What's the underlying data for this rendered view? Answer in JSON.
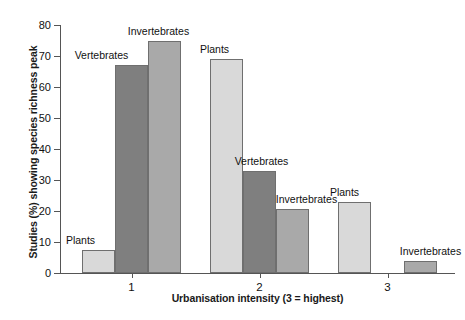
{
  "chart_data": {
    "type": "bar",
    "title": "",
    "xlabel": "Urbanisation intensity (3 = highest)",
    "ylabel": "Studies (%) showing species richness peak",
    "categories": [
      "1",
      "2",
      "3"
    ],
    "ylim": [
      0,
      80
    ],
    "yticks": [
      0,
      10,
      20,
      30,
      40,
      50,
      60,
      70,
      80
    ],
    "ytick_labels": [
      "0",
      "10",
      "20",
      "30",
      "40",
      "50",
      "60",
      "70",
      "80"
    ],
    "grid": false,
    "legend_position": "none",
    "series": [
      {
        "name": "Plants",
        "color": "#d9d9d9",
        "values": [
          7.5,
          69,
          23
        ],
        "labels": [
          "Plants",
          "Plants",
          "Plants"
        ]
      },
      {
        "name": "Vertebrates",
        "color": "#7f7f7f",
        "values": [
          67,
          33,
          null
        ],
        "labels": [
          "Vertebrates",
          "Vertebrates",
          ""
        ]
      },
      {
        "name": "Invertebrates",
        "color": "#a9a9a9",
        "values": [
          75,
          20.5,
          4
        ],
        "labels": [
          "Invertebrates",
          "Invertebrates",
          "Invertebrates"
        ]
      }
    ],
    "annotations": [
      {
        "text": "Plants",
        "group": "1",
        "series": "Plants"
      },
      {
        "text": "Vertebrates",
        "group": "1",
        "series": "Vertebrates"
      },
      {
        "text": "Invertebrates",
        "group": "1",
        "series": "Invertebrates"
      },
      {
        "text": "Plants",
        "group": "2",
        "series": "Plants"
      },
      {
        "text": "Vertebrates",
        "group": "2",
        "series": "Vertebrates"
      },
      {
        "text": "Invertebrates",
        "group": "2",
        "series": "Invertebrates"
      },
      {
        "text": "Plants",
        "group": "3",
        "series": "Plants"
      },
      {
        "text": "Invertebrates",
        "group": "3",
        "series": "Invertebrates"
      }
    ]
  },
  "axes": {
    "y_title": "Studies (%) showing species richness peak",
    "x_title": "Urbanisation intensity (3 = highest)"
  },
  "colors": {
    "plants": "#d9d9d9",
    "vertebrates": "#7f7f7f",
    "invertebrates": "#a9a9a9",
    "axis": "#555555",
    "bar_outline": "#6f6f6f",
    "background": "#ffffff"
  }
}
